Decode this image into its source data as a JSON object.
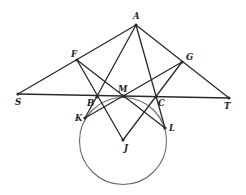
{
  "diagram": {
    "type": "geometry-construction",
    "circle": {
      "center": "J",
      "cx": 123,
      "cy": 141,
      "r": 43.5
    },
    "points": [
      {
        "name": "A",
        "x": 136,
        "y": 25,
        "label": "A",
        "lx": 133,
        "ly": 19
      },
      {
        "name": "F",
        "x": 77,
        "y": 60,
        "label": "F",
        "lx": 71,
        "ly": 57
      },
      {
        "name": "G",
        "x": 182,
        "y": 62,
        "label": "G",
        "lx": 186,
        "ly": 60
      },
      {
        "name": "S",
        "x": 18,
        "y": 94,
        "label": "S",
        "lx": 15,
        "ly": 105
      },
      {
        "name": "T",
        "x": 229,
        "y": 98,
        "label": "T",
        "lx": 224,
        "ly": 109
      },
      {
        "name": "M",
        "x": 124,
        "y": 96,
        "label": "M",
        "lx": 118,
        "ly": 92
      },
      {
        "name": "B",
        "x": 97,
        "y": 97,
        "label": "B",
        "lx": 87,
        "ly": 106
      },
      {
        "name": "C",
        "x": 156,
        "y": 97,
        "label": "C",
        "lx": 158,
        "ly": 106
      },
      {
        "name": "K",
        "x": 85,
        "y": 118,
        "label": "K",
        "lx": 75,
        "ly": 121
      },
      {
        "name": "L",
        "x": 165,
        "y": 128,
        "label": "L",
        "lx": 169,
        "ly": 131
      },
      {
        "name": "J",
        "x": 123,
        "y": 140,
        "label": "J",
        "lx": 124,
        "ly": 151
      }
    ],
    "segments": [
      {
        "from": "S",
        "to": "A"
      },
      {
        "from": "A",
        "to": "T"
      },
      {
        "from": "S",
        "to": "T"
      },
      {
        "from": "A",
        "to": "K"
      },
      {
        "from": "A",
        "to": "L"
      },
      {
        "from": "F",
        "to": "J"
      },
      {
        "from": "G",
        "to": "J"
      },
      {
        "from": "F",
        "to": "L"
      },
      {
        "from": "G",
        "to": "K"
      }
    ],
    "colors": {
      "line": "#2a2a2a",
      "circle": "#6a6a6a",
      "background": "#ffffff"
    }
  }
}
